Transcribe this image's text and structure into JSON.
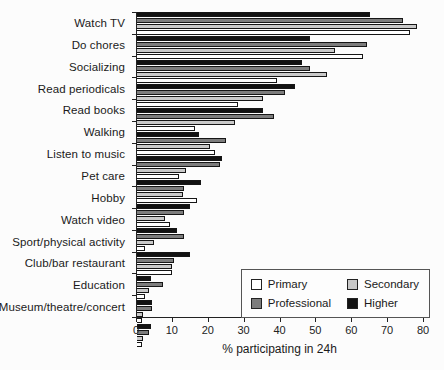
{
  "chart_data": {
    "type": "bar",
    "orientation": "horizontal",
    "title": "",
    "xlabel": "% participating in 24h",
    "ylabel": "",
    "xlim": [
      0,
      80
    ],
    "xticks": [
      0,
      10,
      20,
      30,
      40,
      50,
      60,
      70,
      80
    ],
    "grid": "off",
    "legend_position": "bottom-right",
    "bar_order_top_to_bottom": [
      "Higher",
      "Professional",
      "Secondary",
      "Primary"
    ],
    "categories": [
      "Watch TV",
      "Do chores",
      "Socializing",
      "Read periodicals",
      "Read books",
      "Walking",
      "Listen to music",
      "Pet care",
      "Hobby",
      "Watch video",
      "Sport/physical activity",
      "Club/bar restaurant",
      "Education",
      "Museum/theatre/concert"
    ],
    "series": [
      {
        "name": "Primary",
        "color": "#ffffff",
        "values": [
          76,
          63,
          39,
          28,
          16,
          21.5,
          11.5,
          16.5,
          9,
          2,
          9.5,
          2,
          1,
          1
        ]
      },
      {
        "name": "Secondary",
        "color": "#c9c9c9",
        "values": [
          78,
          55,
          53,
          35,
          27,
          20,
          13.5,
          12.5,
          7.5,
          4.5,
          9.5,
          3,
          1.5,
          1.5
        ]
      },
      {
        "name": "Professional",
        "color": "#7d7d7d",
        "values": [
          74,
          64,
          48,
          41,
          38,
          24.5,
          23,
          13,
          13,
          13,
          10,
          7,
          4,
          3
        ]
      },
      {
        "name": "Higher",
        "color": "#121212",
        "values": [
          65,
          48,
          46,
          44,
          35,
          17,
          23.5,
          17.5,
          14.5,
          11,
          14.5,
          3.5,
          4,
          3.5
        ]
      }
    ]
  }
}
